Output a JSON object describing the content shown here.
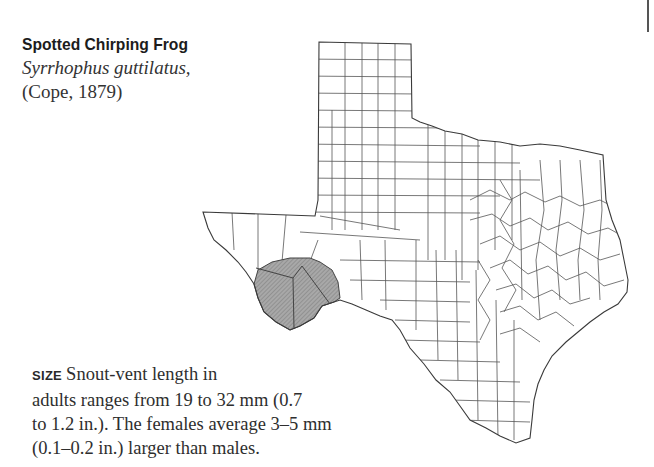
{
  "species": {
    "common_name": "Spotted Chirping Frog",
    "scientific_name": "Syrrhophus guttilatus,",
    "authority": "(Cope, 1879)"
  },
  "map": {
    "region": "Texas",
    "description": "County outline map with shaded range in the Big Bend region",
    "range_fill_color": "#9a9a9a",
    "outline_color": "#3a3a3a"
  },
  "size_section": {
    "label": "SIZE",
    "lines": [
      "Snout-vent length in",
      "adults ranges from 19 to 32 mm (0.7",
      "to 1.2 in.). The females average 3–5 mm",
      "(0.1–0.2 in.) larger than males."
    ]
  },
  "colors": {
    "text": "#2e2e2e",
    "background": "#ffffff"
  }
}
